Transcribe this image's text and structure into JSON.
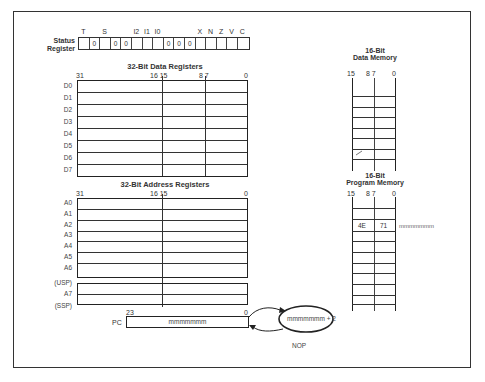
{
  "status_register": {
    "label_line1": "Status",
    "label_line2": "Register",
    "bit_headers": [
      "T",
      "",
      "S",
      "",
      "",
      "I2",
      "I1",
      "I0",
      "",
      "",
      "",
      "X",
      "N",
      "Z",
      "V",
      "C"
    ],
    "bit_values": [
      "",
      "0",
      "",
      "0",
      "0",
      "",
      "",
      "",
      "0",
      "0",
      "0",
      "",
      "",
      "",
      "",
      ""
    ]
  },
  "data_registers": {
    "title": "32-Bit Data Registers",
    "bit_labels": {
      "b31": "31",
      "b16_15": "16 15",
      "b8_7": "8 7",
      "b0": "0"
    },
    "rows": [
      "D0",
      "D1",
      "D2",
      "D3",
      "D4",
      "D5",
      "D6",
      "D7"
    ]
  },
  "address_registers": {
    "title": "32-Bit Address Registers",
    "bit_labels": {
      "b31": "31",
      "b16_15": "16 15",
      "b0": "0"
    },
    "rows": [
      "A0",
      "A1",
      "A2",
      "A3",
      "A4",
      "A5",
      "A6"
    ],
    "stack_pointer": {
      "usp": "(USP)",
      "a7": "A7",
      "ssp": "(SSP)"
    }
  },
  "program_counter": {
    "label": "PC",
    "bit_high": "23",
    "bit_low": "0",
    "value": "mmmmmmm",
    "next_value": "mmmmmmm + 2"
  },
  "data_memory": {
    "title_line1": "16-Bit",
    "title_line2": "Data Memory",
    "bit_labels": {
      "b15": "15",
      "b8_7": "8 7",
      "b0": "0"
    }
  },
  "program_memory": {
    "title_line1": "16-Bit",
    "title_line2": "Program Memory",
    "bit_labels": {
      "b15": "15",
      "b8_7": "8 7",
      "b0": "0"
    },
    "highlight_row": {
      "high_byte": "4E",
      "low_byte": "71",
      "address": "mmmmmmm"
    }
  },
  "instruction": {
    "mnemonic": "NOP"
  },
  "colors": {
    "ink": "#2a2a2a",
    "paper": "#ffffff"
  }
}
